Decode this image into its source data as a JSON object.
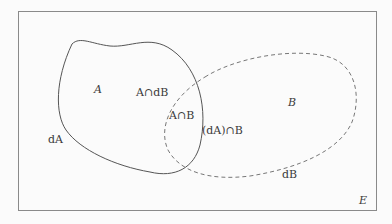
{
  "colors": {
    "background": "#fbfbfb",
    "frame": "#8a8a8a",
    "set_a_stroke": "#555555",
    "set_b_stroke": "#777777",
    "text": "#3a3a3a"
  },
  "diagram": {
    "universe": {
      "label": "E"
    },
    "set_a": {
      "label": "A",
      "boundary_label": "dA",
      "line_style": "solid"
    },
    "set_b": {
      "label": "B",
      "boundary_label": "dB",
      "line_style": "dashed"
    },
    "regions": {
      "a_cap_db": "A∩dB",
      "a_cap_b": "A∩B",
      "da_cap_b": "(dA)∩B"
    }
  }
}
